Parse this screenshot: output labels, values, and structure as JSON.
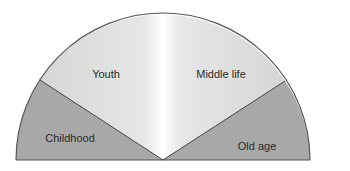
{
  "diagram": {
    "type": "semicircle-life-stages",
    "segments": [
      {
        "id": "childhood",
        "label": "Childhood",
        "color": "#a9a9a9"
      },
      {
        "id": "youth",
        "label": "Youth",
        "color": "#d9d9d9"
      },
      {
        "id": "middle_life",
        "label": "Middle life",
        "color": "#d9d9d9"
      },
      {
        "id": "old_age",
        "label": "Old age",
        "color": "#a9a9a9"
      }
    ],
    "colors": {
      "outline": "#555555",
      "background": "#ffffff",
      "highlight": "#ffffff"
    }
  }
}
